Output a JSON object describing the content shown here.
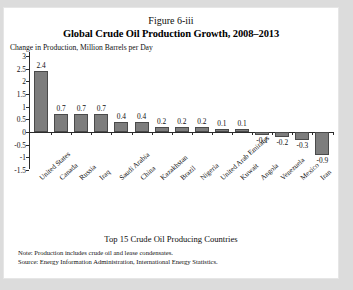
{
  "figure": {
    "number_label": "Figure 6-iii",
    "title": "Global Crude Oil Production Growth, 2008–2013",
    "caption": "Top 15 Crude Oil Producing Countries",
    "note": "Note: Production includes crude oil and lease condensates.",
    "source": "Source: Energy Information Administration, International Energy Statistics."
  },
  "chart_data": {
    "type": "bar",
    "title": "Global Crude Oil Production Growth, 2008–2013",
    "subtitle": "Figure 6-iii",
    "xlabel": "Top 15 Crude Oil Producing Countries",
    "ylabel": "Change in Production, Million Barrels per Day",
    "ylim": [
      -1.5,
      3
    ],
    "yticks": [
      3,
      2.5,
      2,
      1.5,
      1,
      0.5,
      0,
      -0.5,
      -1,
      -1.5
    ],
    "ytick_labels": [
      "3",
      "2.5",
      "2",
      "1.5",
      "1",
      "0.5",
      "0",
      "-0.5",
      "-1",
      "-1.5"
    ],
    "grid": false,
    "legend": false,
    "bar_color": "#7d7d7d",
    "bar_edge_color": "#4a4a4a",
    "categories": [
      "United States",
      "Canada",
      "Russia",
      "Iraq",
      "Saudi Arabia",
      "China",
      "Kazakhstan",
      "Brazil",
      "Nigeria",
      "United Arab Emirates",
      "Kuwait",
      "Angola",
      "Venezuela",
      "Mexico",
      "Iran"
    ],
    "values": [
      2.4,
      0.7,
      0.7,
      0.7,
      0.4,
      0.4,
      0.2,
      0.2,
      0.2,
      0.1,
      0.1,
      -0.1,
      -0.2,
      -0.3,
      -0.9
    ],
    "data_labels": [
      "2.4",
      "0.7",
      "0.7",
      "0.7",
      "0.4",
      "0.4",
      "0.2",
      "0.2",
      "0.2",
      "0.1",
      "0.1",
      "-0.1",
      "-0.2",
      "-0.3",
      "-0.9"
    ]
  }
}
